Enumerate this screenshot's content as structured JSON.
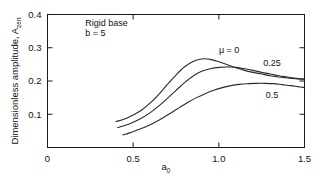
{
  "chart_data": {
    "type": "line",
    "title": "",
    "xlabel": "a0",
    "ylabel": "Dimensionless amplitude, Azen",
    "ylabel_main": "Dimensionless amplitude, A",
    "ylabel_sub": "zen",
    "xlabel_main": "a",
    "xlabel_sub": "0",
    "xlim": [
      0,
      1.5
    ],
    "ylim": [
      0,
      0.4
    ],
    "xticks": [
      0,
      0.5,
      1.0,
      1.5
    ],
    "xtick_labels": [
      "0",
      "0.5",
      "1.0",
      "1.5"
    ],
    "yticks": [
      0.1,
      0.2,
      0.3,
      0.4
    ],
    "ytick_labels": [
      "0.1",
      "0.2",
      "0.3",
      "0.4"
    ],
    "grid": false,
    "legend_position": "inline-right",
    "annotations": [
      {
        "text": "Rigid base",
        "x": 0.22,
        "y": 0.365
      },
      {
        "text": "b = 5",
        "x": 0.22,
        "y": 0.335
      }
    ],
    "series": [
      {
        "name": "mu = 0",
        "label": "μ = 0",
        "label_x": 1.06,
        "label_y": 0.285,
        "color": "#2a2a2a",
        "x": [
          0.4,
          0.45,
          0.5,
          0.55,
          0.6,
          0.65,
          0.7,
          0.75,
          0.8,
          0.85,
          0.9,
          0.92,
          0.95,
          1.0,
          1.05,
          1.1,
          1.15,
          1.2,
          1.25,
          1.3,
          1.35,
          1.4,
          1.45,
          1.5
        ],
        "y": [
          0.078,
          0.086,
          0.098,
          0.113,
          0.134,
          0.16,
          0.19,
          0.218,
          0.243,
          0.259,
          0.266,
          0.267,
          0.265,
          0.258,
          0.249,
          0.24,
          0.232,
          0.226,
          0.221,
          0.216,
          0.212,
          0.209,
          0.207,
          0.206
        ]
      },
      {
        "name": "mu = 0.25",
        "label": "0.25",
        "label_x": 1.31,
        "label_y": 0.245,
        "color": "#2a2a2a",
        "x": [
          0.41,
          0.45,
          0.5,
          0.55,
          0.6,
          0.65,
          0.7,
          0.75,
          0.8,
          0.85,
          0.9,
          0.95,
          1.0,
          1.05,
          1.07,
          1.1,
          1.15,
          1.2,
          1.25,
          1.3,
          1.35,
          1.4,
          1.45,
          1.5
        ],
        "y": [
          0.06,
          0.066,
          0.076,
          0.089,
          0.105,
          0.125,
          0.148,
          0.172,
          0.195,
          0.215,
          0.229,
          0.237,
          0.241,
          0.242,
          0.242,
          0.241,
          0.237,
          0.232,
          0.226,
          0.221,
          0.216,
          0.212,
          0.208,
          0.205
        ]
      },
      {
        "name": "mu = 0.5",
        "label": "0.5",
        "label_x": 1.31,
        "label_y": 0.15,
        "color": "#2a2a2a",
        "x": [
          0.44,
          0.48,
          0.52,
          0.57,
          0.62,
          0.67,
          0.72,
          0.77,
          0.82,
          0.87,
          0.92,
          0.97,
          1.02,
          1.07,
          1.12,
          1.17,
          1.22,
          1.27,
          1.32,
          1.37,
          1.42,
          1.46,
          1.5
        ],
        "y": [
          0.038,
          0.044,
          0.052,
          0.062,
          0.074,
          0.088,
          0.104,
          0.12,
          0.136,
          0.15,
          0.162,
          0.172,
          0.18,
          0.186,
          0.19,
          0.192,
          0.193,
          0.193,
          0.192,
          0.189,
          0.186,
          0.183,
          0.18
        ]
      }
    ]
  }
}
